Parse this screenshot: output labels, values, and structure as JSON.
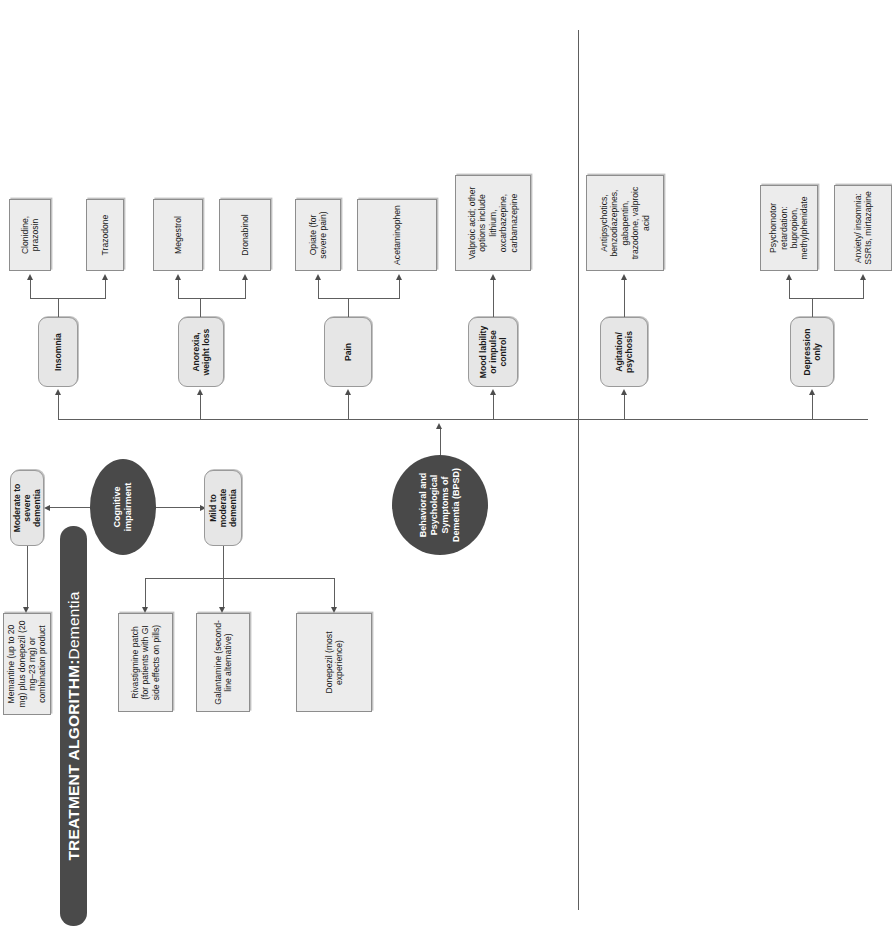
{
  "title": {
    "strong": "TREATMENT ALGORITHM:",
    "light": " Dementia"
  },
  "colors": {
    "title_bar": "#4a4a4a",
    "ellipse": "#494949",
    "category_box": "#e6e6e6",
    "treatment_box": "#ececec",
    "connector": "#5e5e5e",
    "border": "#8d8d8d",
    "text": "#1a1a1a",
    "title_text": "#ffffff"
  },
  "roots": {
    "cognitive": "Cognitive impairment",
    "bpsd": "Behavioral and Psychological Symptoms of Dementia (BPSD)"
  },
  "cognitive_branches": [
    {
      "id": "moderate-to-severe",
      "label": "Moderate to severe dementia",
      "treatments": [
        "Memantine (up to 20 mg) plus donepezil (20 mg–23 mg) or combination product"
      ]
    },
    {
      "id": "mild-to-moderate",
      "label": "Mild to moderate dementia",
      "treatments": [
        "Rivastigmine patch (for patients with GI side effects on pills)",
        "Galantamine (second-line alternative)",
        "Donepezil (most experience)"
      ]
    }
  ],
  "bpsd_branches": [
    {
      "id": "insomnia",
      "label": "Insomnia",
      "treatments": [
        "Clonidine, prazosin",
        "Trazodone"
      ]
    },
    {
      "id": "anorexia-weight-loss",
      "label": "Anorexia, weight loss",
      "treatments": [
        "Megestrol",
        "Dronabinol"
      ]
    },
    {
      "id": "pain",
      "label": "Pain",
      "treatments": [
        "Opiate (for severe pain)",
        "Acetaminophen"
      ]
    },
    {
      "id": "mood-lability",
      "label": "Mood lability or impulse control",
      "treatments": [
        "Valproic acid; other options include lithium, oxcarbazepine, carbamazepine"
      ]
    },
    {
      "id": "agitation-psychosis",
      "label": "Agitation/ psychosis",
      "treatments": [
        "Antipsychotics, benzodiazepines, gabapentin, trazodone, valproic acid"
      ]
    },
    {
      "id": "depression-only",
      "label": "Depression only",
      "treatments": [
        "Psychomotor retardation: bupropion, methylphenidate",
        "Anxiety/ insomnia: SSRIs, mirtazapine"
      ]
    }
  ]
}
